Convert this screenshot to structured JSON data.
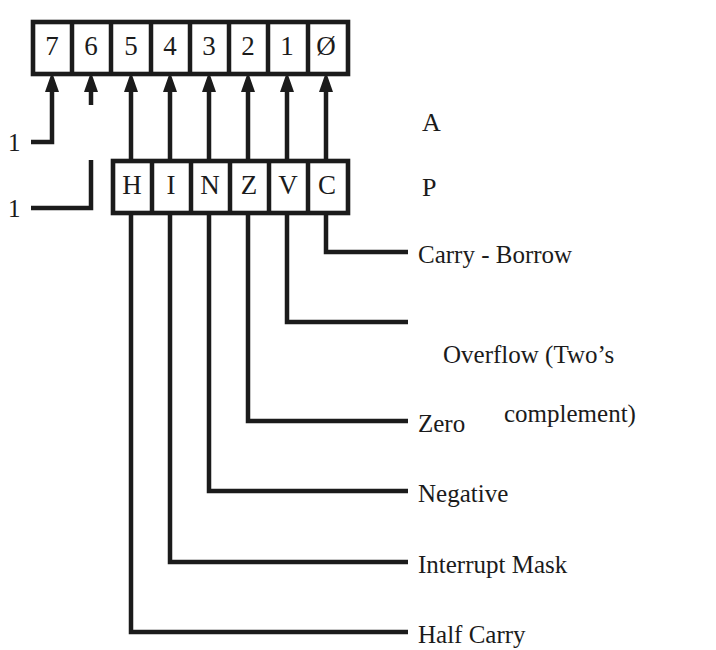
{
  "figure": {
    "accumulator": {
      "register_label": "A",
      "bits": [
        "7",
        "6",
        "5",
        "4",
        "3",
        "2",
        "1",
        "Ø"
      ]
    },
    "condition_code": {
      "register_label": "P",
      "flags": [
        "H",
        "I",
        "N",
        "Z",
        "V",
        "C"
      ]
    },
    "left_markers": [
      {
        "value": "1",
        "target_bit": "7"
      },
      {
        "value": "1",
        "target_bit": "6"
      }
    ],
    "callouts": [
      {
        "flag": "C",
        "label": "Carry - Borrow"
      },
      {
        "flag": "V",
        "label": "Overflow (Two’s",
        "label_line2": "complement)"
      },
      {
        "flag": "Z",
        "label": "Zero"
      },
      {
        "flag": "N",
        "label": "Negative"
      },
      {
        "flag": "I",
        "label": "Interrupt Mask"
      },
      {
        "flag": "H",
        "label": "Half Carry"
      }
    ],
    "colors": {
      "ink": "#1b1b1b",
      "paper": "#ffffff"
    }
  }
}
